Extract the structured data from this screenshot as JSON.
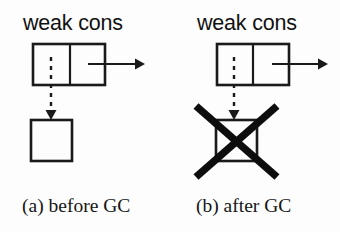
{
  "figure": {
    "background_color": "#fdfdfd",
    "ink_color": "#1a1a1a",
    "panels": [
      {
        "id": "panel-a",
        "heading": "weak cons",
        "caption": "(a) before GC",
        "cons_cell": {
          "car_field_label": "",
          "cdr_field_label": "",
          "x": 33,
          "y": 44,
          "width": 72,
          "height": 41,
          "divider_x": 70
        },
        "cdr_arrow": {
          "x1": 88,
          "y1": 64,
          "x2": 139,
          "y2": 64
        },
        "weak_pointer": {
          "style": "dashed",
          "x": 51,
          "y1": 58,
          "y2": 117
        },
        "target_object": {
          "state": "alive",
          "x": 31,
          "y": 120,
          "width": 41,
          "height": 41
        },
        "collected": false
      },
      {
        "id": "panel-b",
        "heading": "weak cons",
        "caption": "(b) after GC",
        "cons_cell": {
          "car_field_label": "",
          "cdr_field_label": "",
          "x": 217,
          "y": 44,
          "width": 72,
          "height": 41,
          "divider_x": 253
        },
        "cdr_arrow": {
          "x1": 272,
          "y1": 64,
          "x2": 323,
          "y2": 64
        },
        "weak_pointer": {
          "style": "dashed",
          "x": 234,
          "y1": 58,
          "y2": 117
        },
        "target_object": {
          "state": "collected",
          "x": 216,
          "y": 120,
          "width": 41,
          "height": 41
        },
        "collected": true,
        "cross_out": {
          "x1": 196,
          "y1": 106,
          "x2": 277,
          "y2": 177,
          "x3": 277,
          "y3": 106,
          "x4": 196,
          "y4": 177
        }
      }
    ]
  }
}
